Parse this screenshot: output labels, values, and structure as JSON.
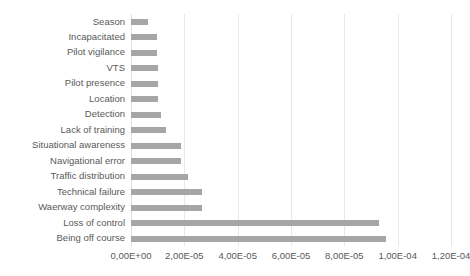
{
  "chart_data": {
    "type": "bar",
    "orientation": "horizontal",
    "title": "",
    "subtitle": "",
    "xlabel": "",
    "ylabel": "",
    "xlim": [
      0,
      0.00012
    ],
    "grid": true,
    "legend": false,
    "bar_color": "#a6a6a6",
    "gridline_color": "#e8e8e8",
    "text_color": "#595959",
    "xticks": [
      "0,00E+00",
      "2,00E-05",
      "4,00E-05",
      "6,00E-05",
      "8,00E-05",
      "1,00E-04",
      "1,20E-04"
    ],
    "xtick_values": [
      0,
      2e-05,
      4e-05,
      6e-05,
      8e-05,
      0.0001,
      0.00012
    ],
    "categories": [
      "Season",
      "Incapacitated",
      "Pilot vigilance",
      "VTS",
      "Pilot presence",
      "Location",
      "Detection",
      "Lack of training",
      "Situational awareness",
      "Navigational error",
      "Traffic distribution",
      "Technical failure",
      "Waerway complexity",
      "Loss of control",
      "Being off course"
    ],
    "values": [
      6.4e-06,
      9.8e-06,
      9.8e-06,
      1e-05,
      1.02e-05,
      1.02e-05,
      1.13e-05,
      1.3e-05,
      1.88e-05,
      1.88e-05,
      2.14e-05,
      2.65e-05,
      2.65e-05,
      9.3e-05,
      9.55e-05
    ]
  }
}
